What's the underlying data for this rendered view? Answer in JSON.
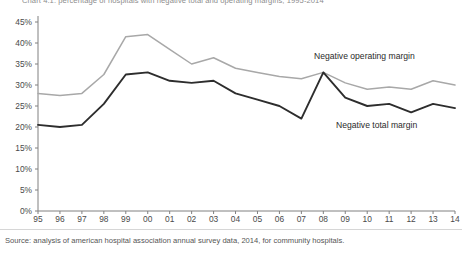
{
  "chart_data": {
    "type": "line",
    "title": "Chart 4.1: percentage of hospitals with negative total and operating margins, 1995-2014",
    "xlabel": "",
    "ylabel": "",
    "categories": [
      "95",
      "96",
      "97",
      "98",
      "99",
      "00",
      "01",
      "02",
      "03",
      "04",
      "05",
      "06",
      "07",
      "08",
      "09",
      "10",
      "11",
      "12",
      "13",
      "14"
    ],
    "ylim": [
      0,
      45
    ],
    "ytick_values": [
      0,
      5,
      10,
      15,
      20,
      25,
      30,
      35,
      40,
      45
    ],
    "ytick_labels": [
      "0%",
      "5%",
      "10%",
      "15%",
      "20%",
      "25%",
      "30%",
      "35%",
      "40%",
      "45%"
    ],
    "grid": false,
    "legend_position": "inline-annotation",
    "series": [
      {
        "name": "Negative operating margin",
        "color": "#a8a8a8",
        "values": [
          28.0,
          27.5,
          28.0,
          32.5,
          41.5,
          42.0,
          38.5,
          35.0,
          36.5,
          34.0,
          33.0,
          32.0,
          31.5,
          33.0,
          30.5,
          29.0,
          29.5,
          29.0,
          31.0,
          30.0
        ]
      },
      {
        "name": "Negative total margin",
        "color": "#2d2d2d",
        "values": [
          20.5,
          20.0,
          20.5,
          25.5,
          32.5,
          33.0,
          31.0,
          30.5,
          31.0,
          28.0,
          26.5,
          25.0,
          22.0,
          33.0,
          27.0,
          25.0,
          25.5,
          23.5,
          25.5,
          24.5
        ]
      }
    ],
    "annotations": [
      {
        "text": "Negative operating margin",
        "series": "Negative operating margin"
      },
      {
        "text": "Negative total margin",
        "series": "Negative total margin"
      }
    ]
  },
  "source": {
    "note": "Source: analysis of american hospital association annual survey data, 2014, for community hospitals."
  }
}
